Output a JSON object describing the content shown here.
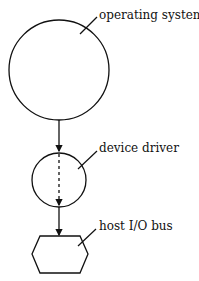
{
  "diagram": {
    "nodes": [
      {
        "id": "os",
        "label": "operating system",
        "shape": "circle"
      },
      {
        "id": "driver",
        "label": "device driver",
        "shape": "circle"
      },
      {
        "id": "bus",
        "label": "host I/O bus",
        "shape": "hexagon"
      }
    ],
    "edges": [
      {
        "from": "os",
        "to": "driver",
        "style": "solid"
      },
      {
        "from": "driver",
        "to": "driver-bottom",
        "style": "dashed"
      },
      {
        "from": "driver",
        "to": "bus",
        "style": "solid"
      }
    ],
    "stroke_color": "#111111"
  }
}
